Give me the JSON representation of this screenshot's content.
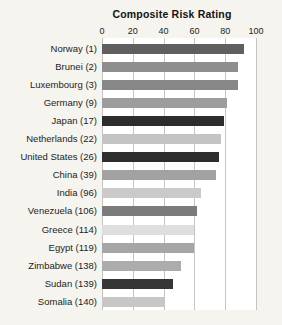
{
  "chart_data": {
    "type": "bar",
    "orientation": "horizontal",
    "title": "Composite Risk Rating",
    "xlabel": "",
    "ylabel": "",
    "axis": {
      "position": "top",
      "ticks": [
        0,
        20,
        40,
        60,
        80,
        100
      ],
      "range": [
        0,
        100
      ],
      "grid": true
    },
    "categories": [
      "Norway (1)",
      "Brunei (2)",
      "Luxembourg (3)",
      "Germany (9)",
      "Japan (17)",
      "Netherlands (22)",
      "United States (26)",
      "China (39)",
      "India (96)",
      "Venezuela (106)",
      "Greece (114)",
      "Egypt (119)",
      "Zimbabwe (138)",
      "Sudan (139)",
      "Somalia (140)"
    ],
    "values": [
      92,
      88,
      88,
      81,
      79,
      77,
      76,
      74,
      64,
      62,
      60,
      59.5,
      51,
      46,
      40.5
    ],
    "bar_colors": [
      "#5f5f5f",
      "#8e8e8e",
      "#878787",
      "#9d9d9d",
      "#2d2d2d",
      "#c4c4c4",
      "#2d2d2d",
      "#a2a2a2",
      "#cacaca",
      "#7b7b7b",
      "#dedede",
      "#a6a6a6",
      "#acacac",
      "#363636",
      "#c7c7c7"
    ]
  },
  "colors": {
    "page_background": "#f6f4ee",
    "plot_background": "#ffffff",
    "gridline": "#c4c4c0",
    "text": "#1d1d1d"
  }
}
